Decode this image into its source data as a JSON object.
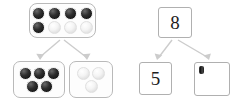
{
  "diagram": {
    "type": "number-bond-with-ten-frames",
    "background_color": "#ffffff",
    "arrow_color": "#c9c9c9",
    "frame_border_color": "#b9b9b9",
    "counter_dark_color": "#1a1a1a",
    "counter_light_color": "#f1f1f1",
    "left_model": {
      "whole": {
        "label": "whole-counter-frame",
        "total_counters": 8,
        "rows": [
          {
            "counters": [
              "dark",
              "dark",
              "dark",
              "dark"
            ]
          },
          {
            "counters": [
              "dark",
              "light",
              "light",
              "light"
            ]
          }
        ]
      },
      "part_one": {
        "label": "part-one-counter-frame",
        "total_counters": 5,
        "rows": [
          {
            "counters": [
              "dark",
              "dark",
              "dark"
            ]
          },
          {
            "counters": [
              "dark",
              "dark"
            ]
          }
        ]
      },
      "part_two": {
        "label": "part-two-counter-frame",
        "total_counters": 3,
        "rows": [
          {
            "counters": [
              "light",
              "light"
            ]
          },
          {
            "counters": [
              "light"
            ]
          }
        ]
      }
    },
    "right_model": {
      "whole_box": {
        "value": "8"
      },
      "part_one_box": {
        "value": "5"
      },
      "part_two_box": {
        "value": "",
        "has_cursor": true
      }
    }
  }
}
